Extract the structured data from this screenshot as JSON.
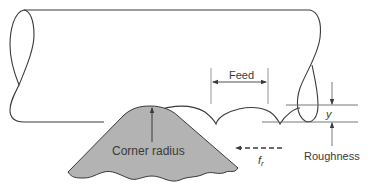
{
  "diagram": {
    "type": "turning-surface-roughness",
    "labels": {
      "feed": "Feed",
      "corner_radius": "Corner radius",
      "y": "y",
      "feed_rate_symbol": "f",
      "feed_rate_subscript": "r",
      "roughness": "Roughness"
    },
    "colors": {
      "line": "#3a3a3a",
      "tool_fill": "#b3b3b3",
      "dim_line": "#6a6a6a",
      "background": "#ffffff"
    }
  }
}
